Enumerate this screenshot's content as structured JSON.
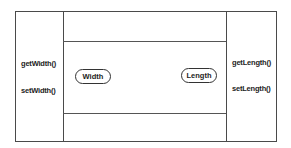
{
  "diagram": {
    "type": "class-encapsulation",
    "left_methods": [
      "getWidth()",
      "setWidth()"
    ],
    "right_methods": [
      "getLength()",
      "setLength()"
    ],
    "attributes": [
      "Width",
      "Length"
    ],
    "line_color": "#4a4a4a"
  }
}
